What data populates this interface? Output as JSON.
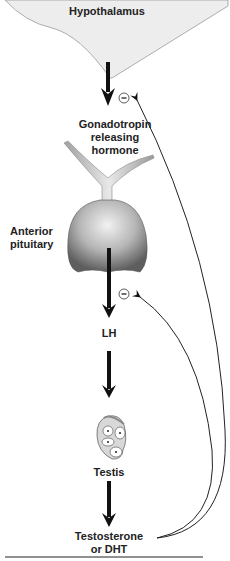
{
  "diagram": {
    "nodes": {
      "hypothalamus": "Hypothalamus",
      "gnrh_line1": "Gonadotropin",
      "gnrh_line2": "releasing",
      "gnrh_line3": "hormone",
      "pituitary_line1": "Anterior",
      "pituitary_line2": "pituitary",
      "lh": "LH",
      "testis": "Testis",
      "testosterone_line1": "Testosterone",
      "testosterone_line2": "or DHT"
    },
    "feedback_symbols": [
      "−",
      "−"
    ],
    "colors": {
      "hypothalamus_fill": "#ededed",
      "arrow": "#111111",
      "pituitary_dark": "#6a6a6a",
      "pituitary_light": "#e0e0e0"
    }
  }
}
